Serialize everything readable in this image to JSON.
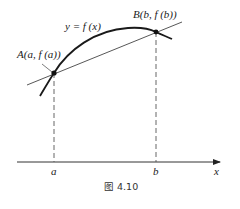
{
  "figure": {
    "caption": "图 4.10",
    "curve_label": "y = f (x)",
    "point_a_label": "A(a, f (a))",
    "point_b_label": "B(b, f (b))",
    "axis": {
      "x_label": "x",
      "tick_labels": [
        "a",
        "b"
      ]
    },
    "colors": {
      "stroke": "#1a1a1a",
      "secant": "#444444",
      "dashed": "#555555"
    }
  }
}
